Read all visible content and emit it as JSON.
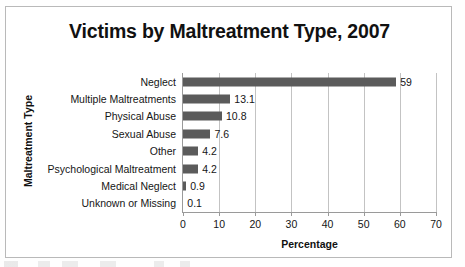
{
  "chart_data": {
    "type": "bar",
    "orientation": "horizontal",
    "title": "Victims by Maltreatment Type, 2007",
    "xlabel": "Percentage",
    "ylabel": "Maltreatment Type",
    "categories": [
      "Neglect",
      "Multiple Maltreatments",
      "Physical Abuse",
      "Sexual Abuse",
      "Other",
      "Psychological Maltreatment",
      "Medical Neglect",
      "Unknown or Missing"
    ],
    "values": [
      59,
      13.1,
      10.8,
      7.6,
      4.2,
      4.2,
      0.9,
      0.1
    ],
    "value_labels": [
      "59",
      "13.1",
      "10.8",
      "7.6",
      "4.2",
      "4.2",
      "0.9",
      "0.1"
    ],
    "xlim": [
      0,
      70
    ],
    "xticks": [
      0,
      10,
      20,
      30,
      40,
      50,
      60,
      70
    ],
    "xtick_labels": [
      "0",
      "10",
      "20",
      "30",
      "40",
      "50",
      "60",
      "70"
    ],
    "grid": "vertical",
    "legend": "none",
    "series_color": "#5b5b5b",
    "gridline_color": "#c3c3c3",
    "axis_color": "#9a9a9a",
    "frame_color": "#b9b9b9",
    "background_color": "#ffffff"
  }
}
